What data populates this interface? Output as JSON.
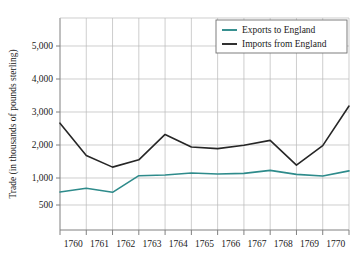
{
  "chart_data": {
    "type": "line",
    "title": "",
    "xlabel": "",
    "ylabel": "Trade (in thousands of pounds sterling)",
    "x_tick_labels": [
      "1760",
      "1761",
      "1762",
      "1763",
      "1764",
      "1765",
      "1766",
      "1767",
      "1768",
      "1769",
      "1770"
    ],
    "y_tick_labels": [
      "500",
      "1,000",
      "2,000",
      "3,000",
      "4,000",
      "5,000"
    ],
    "y_tick_values": [
      500,
      1000,
      2000,
      3000,
      4000,
      5000
    ],
    "ylim": [
      0,
      5600
    ],
    "grid": true,
    "legend_position": "top-right",
    "categories": [
      1760,
      1761,
      1762,
      1763,
      1764,
      1765,
      1766,
      1767,
      1768,
      1769,
      1770,
      1771
    ],
    "series": [
      {
        "name": "Exports to England",
        "color": "#2e8b8b",
        "values": [
          740,
          810,
          735,
          1070,
          1090,
          1150,
          1120,
          1140,
          1230,
          1110,
          1060,
          1215
        ]
      },
      {
        "name": "Imports from England",
        "color": "#262626",
        "values": [
          2660,
          1680,
          1330,
          1550,
          2320,
          1940,
          1890,
          1990,
          2140,
          1390,
          1980,
          3180
        ]
      }
    ]
  },
  "legend": {
    "items": [
      {
        "label": "Exports to England",
        "color": "#2e8b8b"
      },
      {
        "label": "Imports from England",
        "color": "#262626"
      }
    ]
  },
  "axes": {
    "y_title": "Trade (in thousands of pounds sterling)"
  }
}
